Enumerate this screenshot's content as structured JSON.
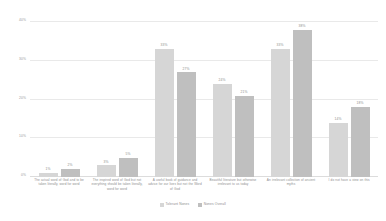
{
  "chart_data": {
    "type": "bar",
    "title": "",
    "xlabel": "",
    "ylabel": "",
    "ylim": [
      0,
      40
    ],
    "grid": true,
    "legend_position": "bottom",
    "categories": [
      "The actual word of God and to be taken literally, word for word",
      "The inspired word of God but not everything should be taken literally, word for word",
      "A useful book of guidance and advice for our lives but not the Word of God",
      "Beautiful literature but otherwise irrelevant to us today",
      "An irrelevant collection of ancient myths",
      "I do not have a view on this"
    ],
    "yticks": [
      "0%",
      "10%",
      "20%",
      "30%",
      "40%"
    ],
    "ytick_values": [
      0,
      10,
      20,
      30,
      40
    ],
    "series": [
      {
        "name": "Tolerant Nones",
        "color": "#d6d6d6",
        "values": [
          1,
          3,
          33,
          24,
          33,
          14
        ],
        "labels": [
          "1%",
          "3%",
          "33%",
          "24%",
          "33%",
          "14%"
        ]
      },
      {
        "name": "Nones Overall",
        "color": "#bfbfbf",
        "values": [
          2,
          5,
          27,
          21,
          38,
          18
        ],
        "labels": [
          "2%",
          "5%",
          "27%",
          "21%",
          "38%",
          "18%"
        ]
      }
    ]
  }
}
